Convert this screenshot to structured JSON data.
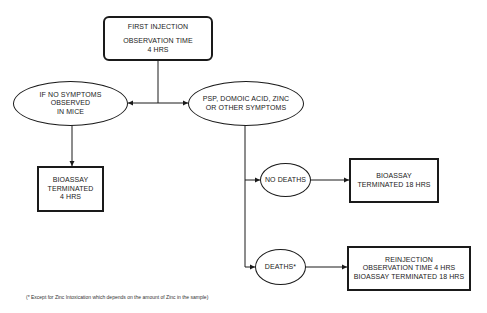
{
  "diagram": {
    "type": "flowchart",
    "nodes": {
      "first_injection": {
        "shape": "rounded-rectangle",
        "line1": "FIRST INJECTION",
        "line2": "OBSERVATION TIME",
        "line3": "4 HRS"
      },
      "no_symptoms": {
        "shape": "ellipse",
        "line1": "IF NO SYMPTOMS",
        "line2": "OBSERVED",
        "line3": "IN MICE"
      },
      "symptoms": {
        "shape": "ellipse",
        "line1": "PSP, DOMOIC ACID, ZINC",
        "line2": "OR OTHER SYMPTOMS"
      },
      "bioassay_4h": {
        "shape": "rectangle",
        "line1": "BIOASSAY",
        "line2": "TERMINATED",
        "line3": "4 HRS"
      },
      "no_deaths": {
        "shape": "ellipse",
        "line1": "NO DEATHS"
      },
      "bioassay_18h": {
        "shape": "rectangle",
        "line1": "BIOASSAY",
        "line2": "TERMINATED 18 HRS"
      },
      "deaths": {
        "shape": "ellipse",
        "line1": "DEATHS*"
      },
      "reinjection": {
        "shape": "rectangle",
        "line1": "REINJECTION",
        "line2": "OBSERVATION TIME 4 HRS",
        "line3": "BIOASSAY TERMINATED 18 HRS"
      }
    },
    "edges": [
      {
        "from": "first_injection",
        "to": "no_symptoms"
      },
      {
        "from": "first_injection",
        "to": "symptoms"
      },
      {
        "from": "no_symptoms",
        "to": "bioassay_4h"
      },
      {
        "from": "symptoms",
        "to": "no_deaths"
      },
      {
        "from": "symptoms",
        "to": "deaths"
      },
      {
        "from": "no_deaths",
        "to": "bioassay_18h"
      },
      {
        "from": "deaths",
        "to": "reinjection"
      }
    ],
    "footnote": "(* Except for Zinc Intoxication which depends on the amount of Zinc in the sample)",
    "colors": {
      "line": "#1a1a1a",
      "background": "#ffffff"
    }
  }
}
